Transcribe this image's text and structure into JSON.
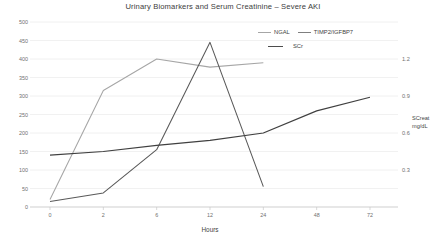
{
  "chart_data": {
    "type": "line",
    "title": "Urinary Biomarkers and Serum Creatinine – Severe AKI",
    "xlabel": "Hours",
    "ylabel": "",
    "y2label": "SCreat\nmg/dL",
    "x": [
      0,
      2,
      6,
      12,
      24,
      48,
      72
    ],
    "xtick_labels": [
      "0",
      "2",
      "6",
      "12",
      "24",
      "48",
      "72"
    ],
    "ylim": [
      0,
      500
    ],
    "ytick_labels": [
      "0",
      "50",
      "100",
      "150",
      "200",
      "250",
      "300",
      "350",
      "400",
      "450",
      "500"
    ],
    "yticks": [
      0,
      50,
      100,
      150,
      200,
      250,
      300,
      350,
      400,
      450,
      500
    ],
    "y2lim": [
      0,
      1.5
    ],
    "y2tick_labels": [
      "0.3",
      "0.6",
      "0.9",
      "1.2"
    ],
    "y2ticks": [
      0.3,
      0.6,
      0.9,
      1.2
    ],
    "grid": true,
    "legend_position": "top-right",
    "series": [
      {
        "name": "NGAL",
        "axis": "left",
        "color": "#a6a6a6",
        "x": [
          0,
          2,
          6,
          12,
          24
        ],
        "values": [
          20,
          315,
          400,
          378,
          390
        ]
      },
      {
        "name": "TIMP2/IGFBP7",
        "axis": "left",
        "color": "#595959",
        "x": [
          0,
          2,
          6,
          12,
          24
        ],
        "values": [
          15,
          38,
          155,
          445,
          55
        ]
      },
      {
        "name": "SCr",
        "axis": "right",
        "color": "#404040",
        "x": [
          0,
          2,
          6,
          12,
          24,
          48,
          72
        ],
        "values": [
          0.42,
          0.45,
          0.5,
          0.54,
          0.6,
          0.78,
          0.89
        ]
      }
    ]
  },
  "legend": {
    "items": [
      {
        "label": "NGAL",
        "swatch": "line-swatch-ngal"
      },
      {
        "label": "TIMP2/IGFBP7",
        "swatch": "line-swatch-timp2"
      },
      {
        "label": "SCr",
        "swatch": "line-swatch-scr"
      }
    ]
  },
  "axis_titles": {
    "x": "Hours",
    "y2_line1": "SCreat",
    "y2_line2": "mg/dL"
  }
}
